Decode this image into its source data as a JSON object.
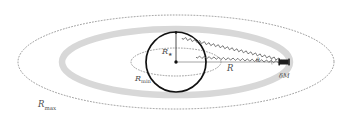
{
  "figure": {
    "kind": "schematic-diagram",
    "caption_text": "",
    "background_color": "#ffffff"
  },
  "colors": {
    "band_gray": "#d8d8d8",
    "dotted_gray": "#7a7a7a",
    "line_gray": "#888888",
    "circle_black": "#111111",
    "label_gray": "#4d4d4d",
    "marker_black": "#1a1a1a"
  },
  "labels": {
    "r_max": {
      "base": "R",
      "sub": "max"
    },
    "r_min": {
      "base": "R",
      "sub": "min"
    },
    "r_star": {
      "base": "R",
      "sub": "★"
    },
    "r": {
      "base": "R",
      "sub": ""
    },
    "delta_m": {
      "base": "δM",
      "sub": ""
    },
    "theta": {
      "base": "θ",
      "sub": ""
    }
  },
  "elements": {
    "outer_dotted_ellipse": {
      "name": "R_max orbit",
      "cx": 176,
      "cy": 62,
      "rx": 158,
      "ry": 47,
      "style": "dotted"
    },
    "gray_band_ellipse": {
      "name": "habitable zone band",
      "cx": 176,
      "cy": 62,
      "rx": 114,
      "ry": 33,
      "stroke_width": 6,
      "style": "solid-gray"
    },
    "inner_dotted_ellipse": {
      "name": "R_min orbit",
      "cx": 176,
      "cy": 62,
      "rx": 45,
      "ry": 14,
      "style": "dotted"
    },
    "star_circle": {
      "name": "central star",
      "cx": 176,
      "cy": 62,
      "r": 30,
      "style": "solid-black"
    },
    "center_point": {
      "cx": 176,
      "cy": 62
    },
    "radius_up_line": {
      "x1": 176,
      "y1": 62,
      "x2": 176,
      "y2": 32
    },
    "radius_right_line": {
      "x1": 176,
      "y1": 62,
      "x2": 284,
      "y2": 62
    },
    "planet_marker": {
      "cx": 284,
      "cy": 62,
      "w": 9,
      "h": 5
    },
    "squiggle_upper": {
      "x1": 182,
      "y1": 38,
      "x2": 282,
      "y2": 60
    },
    "squiggle_lower": {
      "x1": 196,
      "y1": 57,
      "x2": 282,
      "y2": 62
    }
  },
  "label_positions": {
    "r_max": {
      "x": 38,
      "y": 106
    },
    "r_min": {
      "x": 135,
      "y": 80
    },
    "r_star": {
      "x": 163,
      "y": 53
    },
    "r": {
      "x": 229,
      "y": 70
    },
    "delta_m": {
      "x": 283,
      "y": 77
    },
    "theta": {
      "x": 257,
      "y": 60
    }
  }
}
